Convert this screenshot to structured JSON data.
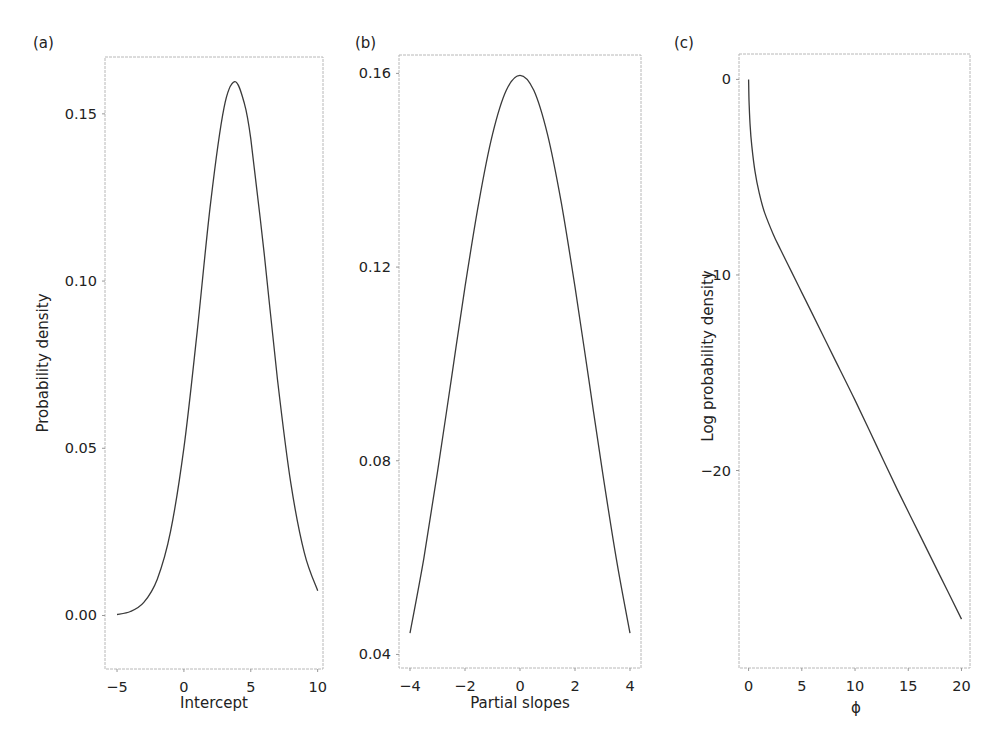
{
  "chart_data": [
    {
      "panel": "(a)",
      "type": "line",
      "title": "",
      "xlabel": "Intercept",
      "ylabel": "Probability density",
      "xlim": [
        -5.9,
        10.4
      ],
      "ylim": [
        -0.016,
        0.167
      ],
      "xticks": [
        -5,
        0,
        5,
        10
      ],
      "xtick_labels": [
        "−5",
        "0",
        "5",
        "10"
      ],
      "yticks": [
        0.0,
        0.05,
        0.1,
        0.15
      ],
      "ytick_labels": [
        "0.00",
        "0.05",
        "0.10",
        "0.15"
      ],
      "grid": false,
      "description": "Normal density, mean ≈ 3.8, sd ≈ 2.5",
      "x": [
        -5,
        -4,
        -3,
        -2,
        -1,
        0,
        1,
        2,
        3,
        3.8,
        4.5,
        5,
        6,
        7,
        8,
        9,
        10
      ],
      "y": [
        0.0003,
        0.0012,
        0.0039,
        0.0108,
        0.0251,
        0.0501,
        0.0852,
        0.1236,
        0.1518,
        0.1596,
        0.1534,
        0.1425,
        0.1082,
        0.0705,
        0.0394,
        0.0188,
        0.0074
      ]
    },
    {
      "panel": "(b)",
      "type": "line",
      "title": "",
      "xlabel": "Partial slopes",
      "ylabel": "",
      "xlim": [
        -4.4,
        4.4
      ],
      "ylim": [
        0.0372,
        0.1638
      ],
      "xticks": [
        -4,
        -2,
        0,
        2,
        4
      ],
      "xtick_labels": [
        "−4",
        "−2",
        "0",
        "2",
        "4"
      ],
      "yticks": [
        0.04,
        0.08,
        0.12,
        0.16
      ],
      "ytick_labels": [
        "0.04",
        "0.08",
        "0.12",
        "0.16"
      ],
      "grid": false,
      "description": "Normal density, mean 0, sd ≈ 2.5",
      "x": [
        -4,
        -3.5,
        -3,
        -2.5,
        -2,
        -1.5,
        -1,
        -0.5,
        0,
        0.5,
        1,
        1.5,
        2,
        2.5,
        3,
        3.5,
        4
      ],
      "y": [
        0.0444,
        0.0598,
        0.0777,
        0.0968,
        0.1159,
        0.1333,
        0.1474,
        0.1565,
        0.1596,
        0.1565,
        0.1474,
        0.1333,
        0.1159,
        0.0968,
        0.0777,
        0.0598,
        0.0444
      ]
    },
    {
      "panel": "(c)",
      "type": "line",
      "title": "",
      "xlabel": "ϕ",
      "ylabel": "Log probability density",
      "xlim": [
        -0.9,
        20.8
      ],
      "ylim": [
        -30.1,
        1.3
      ],
      "xticks": [
        0,
        5,
        10,
        15,
        20
      ],
      "xtick_labels": [
        "0",
        "5",
        "10",
        "15",
        "20"
      ],
      "yticks": [
        0,
        -10,
        -20
      ],
      "ytick_labels": [
        "0",
        "−10",
        "−20"
      ],
      "grid": false,
      "x": [
        0.0,
        0.05,
        0.15,
        0.3,
        0.6,
        1.0,
        1.5,
        2.3,
        3.0,
        4.0,
        5.0,
        6.0,
        8.0,
        10.0,
        12.0,
        14.0,
        16.0,
        18.0,
        20.0
      ],
      "y": [
        0.0,
        -1.2,
        -2.4,
        -3.4,
        -4.7,
        -5.8,
        -6.8,
        -7.9,
        -8.7,
        -9.8,
        -10.9,
        -12.0,
        -14.2,
        -16.4,
        -18.7,
        -21.0,
        -23.2,
        -25.4,
        -27.6
      ]
    }
  ]
}
